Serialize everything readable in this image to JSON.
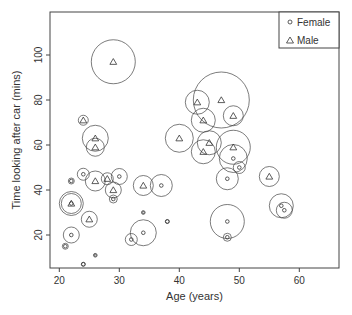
{
  "chart_data": {
    "type": "scatter",
    "title": "",
    "xlabel": "Age (years)",
    "ylabel": "Time looking after car (mins)",
    "xlim": [
      18.5,
      66
    ],
    "ylim": [
      5,
      117
    ],
    "xticks": [
      20,
      30,
      40,
      50,
      60
    ],
    "yticks": [
      20,
      40,
      60,
      80,
      100
    ],
    "grid": false,
    "legend": {
      "position": "top-right",
      "entries": [
        {
          "label": "Female",
          "marker": "circle"
        },
        {
          "label": "Male",
          "marker": "triangle"
        }
      ]
    },
    "bubble_note": "Each point surrounded by a circle whose radius (px) encodes a third variable",
    "series": [
      {
        "name": "Female",
        "marker": "circle",
        "points": [
          {
            "x": 21,
            "y": 15,
            "r": 3
          },
          {
            "x": 22,
            "y": 44,
            "r": 3
          },
          {
            "x": 24,
            "y": 47,
            "r": 6
          },
          {
            "x": 22,
            "y": 34,
            "r": 12
          },
          {
            "x": 22,
            "y": 20,
            "r": 8
          },
          {
            "x": 26,
            "y": 11,
            "r": 1
          },
          {
            "x": 24,
            "y": 7,
            "r": 2
          },
          {
            "x": 29,
            "y": 36,
            "r": 4
          },
          {
            "x": 30,
            "y": 46,
            "r": 8
          },
          {
            "x": 32,
            "y": 18,
            "r": 6
          },
          {
            "x": 34,
            "y": 21,
            "r": 13
          },
          {
            "x": 34,
            "y": 30,
            "r": 1
          },
          {
            "x": 37,
            "y": 42,
            "r": 11
          },
          {
            "x": 38,
            "y": 26,
            "r": 2
          },
          {
            "x": 48,
            "y": 45,
            "r": 11
          },
          {
            "x": 49,
            "y": 54,
            "r": 14
          },
          {
            "x": 50,
            "y": 50,
            "r": 6
          },
          {
            "x": 48,
            "y": 26,
            "r": 17
          },
          {
            "x": 48,
            "y": 19,
            "r": 4
          },
          {
            "x": 57,
            "y": 33,
            "r": 12
          },
          {
            "x": 57.5,
            "y": 31,
            "r": 8
          }
        ]
      },
      {
        "name": "Male",
        "marker": "triangle",
        "points": [
          {
            "x": 29,
            "y": 97,
            "r": 22
          },
          {
            "x": 24,
            "y": 71,
            "r": 5
          },
          {
            "x": 26,
            "y": 63,
            "r": 13
          },
          {
            "x": 26,
            "y": 59,
            "r": 9
          },
          {
            "x": 26,
            "y": 44,
            "r": 10
          },
          {
            "x": 28,
            "y": 45,
            "r": 6
          },
          {
            "x": 29,
            "y": 40,
            "r": 8
          },
          {
            "x": 22,
            "y": 34,
            "r": 10
          },
          {
            "x": 25,
            "y": 27,
            "r": 8
          },
          {
            "x": 34,
            "y": 42,
            "r": 10
          },
          {
            "x": 43,
            "y": 79,
            "r": 12
          },
          {
            "x": 47,
            "y": 80,
            "r": 28
          },
          {
            "x": 49,
            "y": 73,
            "r": 10
          },
          {
            "x": 44,
            "y": 71,
            "r": 12
          },
          {
            "x": 40,
            "y": 63,
            "r": 14
          },
          {
            "x": 45,
            "y": 61,
            "r": 12
          },
          {
            "x": 44,
            "y": 57,
            "r": 12
          },
          {
            "x": 49,
            "y": 59,
            "r": 17
          },
          {
            "x": 55,
            "y": 46,
            "r": 10
          }
        ]
      }
    ]
  },
  "colors": {
    "ink": "#333333",
    "axis": "#444444",
    "background": "#ffffff"
  }
}
